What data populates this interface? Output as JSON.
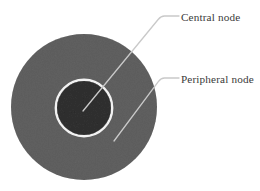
{
  "figure": {
    "background_color": "#ffffff",
    "width": 260,
    "height": 191
  },
  "diagram": {
    "type": "concentric-circles-annotated",
    "peripheral_node": {
      "label": "Peripheral node",
      "shape": "circle",
      "fill_color": "#9b9b9b",
      "center_x": 84,
      "center_y": 107,
      "diameter": 146,
      "texture": "fine-noise"
    },
    "central_node": {
      "label": "Central node",
      "shape": "circle",
      "fill_color": "#6e6e6e",
      "ring_color": "#f2f2f2",
      "ring_width": 2.4,
      "center_x": 84,
      "center_y": 108,
      "diameter": 54
    }
  },
  "leaders": {
    "line_color": "#c9c9c9",
    "line_width": 1.3,
    "central": {
      "target_x": 83,
      "target_y": 111,
      "bend_x": 161,
      "bend_y": 16,
      "end_x": 179,
      "end_y": 16
    },
    "peripheral": {
      "target_x": 114,
      "target_y": 141,
      "bend_x": 161,
      "bend_y": 78,
      "end_x": 179,
      "end_y": 78
    }
  },
  "labels": {
    "central": "Central node",
    "peripheral": "Peripheral node",
    "text_color": "#3a3a3a"
  }
}
